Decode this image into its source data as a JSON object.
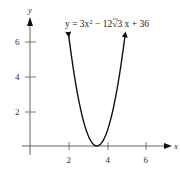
{
  "chart_data": {
    "type": "line",
    "title": "",
    "equation_label": "y = 3x² − 12√3 x + 36",
    "function": "3*x^2 - 12*sqrt(3)*x + 36",
    "vertex": [
      3.464,
      0
    ],
    "xlabel": "x",
    "ylabel": "y",
    "xticks": [
      2,
      4,
      6
    ],
    "yticks": [
      2,
      4,
      6
    ],
    "xtick_labels": [
      "2",
      "4",
      "6"
    ],
    "ytick_labels": [
      "2",
      "4",
      "6"
    ],
    "xlim": [
      0,
      7
    ],
    "ylim": [
      0,
      7
    ],
    "curve_x_range": [
      2.0,
      4.93
    ],
    "grid": false,
    "series": [
      {
        "name": "y = 3x² − 12√3 x + 36",
        "x": [
          2.0,
          2.5,
          3.0,
          3.464,
          4.0,
          4.5,
          4.93
        ],
        "y": [
          6.43,
          2.79,
          0.65,
          0.0,
          0.86,
          3.22,
          6.43
        ]
      }
    ]
  },
  "labels": {
    "x_axis": "x",
    "y_axis": "y",
    "x_ticks": [
      "2",
      "4",
      "6"
    ],
    "y_ticks": [
      "2",
      "4",
      "6"
    ],
    "equation": {
      "lhs": "y = 3x",
      "exp": "2",
      "mid": " − 12",
      "radicand": "3",
      "rhs": " x + 36"
    }
  }
}
